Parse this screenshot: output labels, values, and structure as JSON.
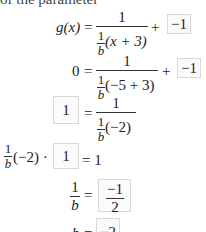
{
  "header_fragment": "of the parameter",
  "steps": [
    {
      "lhs": "g(x)",
      "eq": "=",
      "frac_num": "1",
      "den_coef_num": "1",
      "den_coef_den": "b",
      "den_rest": "(x + 3)",
      "plus": "+",
      "box": "−1"
    },
    {
      "lhs": "0",
      "eq": "=",
      "frac_num": "1",
      "den_coef_num": "1",
      "den_coef_den": "b",
      "den_rest": "(−5 + 3)",
      "plus": "+",
      "box": "−1"
    },
    {
      "box": "1",
      "eq": "=",
      "frac_num": "1",
      "den_coef_num": "1",
      "den_coef_den": "b",
      "den_rest": "(−2)"
    },
    {
      "coef_num": "1",
      "coef_den": "b",
      "rest": "(−2) ·",
      "box": "1",
      "rhs": "= 1"
    },
    {
      "lhs_num": "1",
      "lhs_den": "b",
      "eq": "=",
      "box_num": "−1",
      "box_den": "2"
    },
    {
      "lhs": "b",
      "eq": "=",
      "box": "−2"
    }
  ]
}
